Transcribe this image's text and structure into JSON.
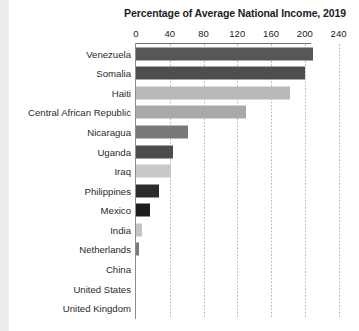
{
  "chart_data": {
    "type": "bar",
    "orientation": "horizontal",
    "title": "Percentage of Average National Income, 2019",
    "xlabel": "",
    "ylabel": "",
    "xlim": [
      0,
      250
    ],
    "xticks": [
      0,
      40,
      80,
      120,
      160,
      200,
      240
    ],
    "xtick_labels": [
      "0",
      "40",
      "80",
      "120",
      "160",
      "200",
      "240"
    ],
    "grid": "vertical-dotted",
    "legend": "none",
    "categories": [
      "Venezuela",
      "Somalia",
      "Haiti",
      "Central African Republic",
      "Nicaragua",
      "Uganda",
      "Iraq",
      "Philippines",
      "Mexico",
      "India",
      "Netherlands",
      "China",
      "United States",
      "United Kingdom"
    ],
    "values": [
      210,
      200,
      182,
      130,
      62,
      44,
      41,
      27,
      17,
      7,
      3,
      0,
      0,
      0
    ],
    "bar_colors": [
      "#555759",
      "#4c4e50",
      "#b8b9b9",
      "#a8a9a9",
      "#76787a",
      "#4a4c4e",
      "#c8c9c9",
      "#2b2c2e",
      "#1c1d1f",
      "#c4c5c5",
      "#787a7c",
      "#8d8d8d",
      "#8d8d8d",
      "#8d8d8d"
    ],
    "axis_color": "#8d8d8d",
    "gridline_color": "#b9b9b9",
    "title_color": "#1d1d1d",
    "background_color": "#ffffff"
  }
}
